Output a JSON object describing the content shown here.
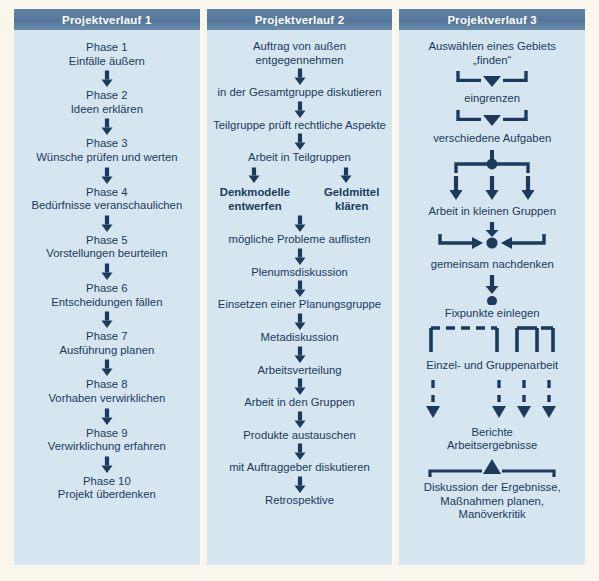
{
  "figure": {
    "background_color": "#faf6ec",
    "panel_color": "#d5e6f0",
    "header_color": "#5b7d9e",
    "text_color": "#1b3a5c"
  },
  "columns": [
    {
      "id": "projektverlauf-1",
      "header": "Projektverlauf 1",
      "nodes": [
        {
          "text": "Phase 1\nEinfälle äußern",
          "bold": false
        },
        {
          "text": "Phase 2\nIdeen erklären",
          "bold": false
        },
        {
          "text": "Phase 3\nWünsche prüfen und werten",
          "bold": false
        },
        {
          "text": "Phase 4\nBedürfnisse veranschaulichen",
          "bold": false
        },
        {
          "text": "Phase 5\nVorstellungen beurteilen",
          "bold": false
        },
        {
          "text": "Phase 6\nEntscheidungen fällen",
          "bold": false
        },
        {
          "text": "Phase 7\nAusführung planen",
          "bold": false
        },
        {
          "text": "Phase 8\nVorhaben verwirklichen",
          "bold": false
        },
        {
          "text": "Phase 9\nVerwirklichung erfahren",
          "bold": false
        },
        {
          "text": "Phase 10\nProjekt überdenken",
          "bold": false
        }
      ]
    },
    {
      "id": "projektverlauf-2",
      "header": "Projektverlauf 2",
      "nodes": [
        {
          "text": "Auftrag von außen entgegennehmen",
          "bold": false
        },
        {
          "text": "in der Gesamtgruppe diskutieren",
          "bold": false
        },
        {
          "text": "Teilgruppe prüft rechtliche Aspekte",
          "bold": false
        },
        {
          "text": "Arbeit in Teilgruppen",
          "bold": false
        },
        {
          "text": "Denkmodelle\nentwerfen",
          "bold": true
        },
        {
          "text": "Geldmittel\nklären",
          "bold": true
        },
        {
          "text": "mögliche Probleme auflisten",
          "bold": false
        },
        {
          "text": "Plenumsdiskussion",
          "bold": false
        },
        {
          "text": "Einsetzen einer Planungsgruppe",
          "bold": false
        },
        {
          "text": "Metadiskussion",
          "bold": false
        },
        {
          "text": "Arbeitsverteilung",
          "bold": false
        },
        {
          "text": "Arbeit in den Gruppen",
          "bold": false
        },
        {
          "text": "Produkte austauschen",
          "bold": false
        },
        {
          "text": "mit Auftraggeber diskutieren",
          "bold": false
        },
        {
          "text": "Retrospektive",
          "bold": false
        }
      ]
    },
    {
      "id": "projektverlauf-3",
      "header": "Projektverlauf 3",
      "nodes": [
        {
          "text": "Auswählen eines Gebiets\n„finden“",
          "bold": false
        },
        {
          "text": "eingrenzen",
          "bold": false
        },
        {
          "text": "verschiedene Aufgaben",
          "bold": false
        },
        {
          "text": "Arbeit in kleinen Gruppen",
          "bold": false
        },
        {
          "text": "gemeinsam nachdenken",
          "bold": false
        },
        {
          "text": "Fixpunkte einlegen",
          "bold": false
        },
        {
          "text": "Einzel- und Gruppenarbeit",
          "bold": false
        },
        {
          "text": "Berichte\nArbeitsergebnisse",
          "bold": false
        },
        {
          "text": "Diskussion der Ergebnisse,\nMaßnahmen planen,\nManöverkritik",
          "bold": false
        }
      ]
    }
  ],
  "connectors": {
    "down_arrow": "arrow-down-icon",
    "funnel_merge": "funnel-merge-down-icon",
    "split_three": "split-three-ways-icon",
    "merge_three": "merge-three-ways-icon",
    "dot": "junction-dot-icon",
    "dashed_brackets": "dashed-brackets-icon",
    "dashed_arrows": "dashed-arrows-down-icon",
    "merge_up": "merge-up-triangle-icon"
  }
}
